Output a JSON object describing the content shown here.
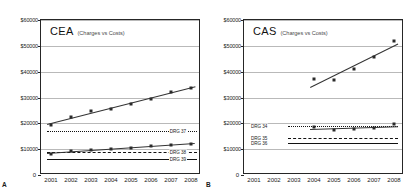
{
  "figure": {
    "panels": [
      {
        "letter": "A",
        "title": "CEA",
        "subtitle": "(Charges vs Costs)"
      },
      {
        "letter": "B",
        "title": "CAS",
        "subtitle": "(Charges vs Costs)"
      }
    ]
  },
  "chart_data": [
    {
      "type": "scatter",
      "panel": "A",
      "title": "CEA",
      "subtitle": "(Charges vs Costs)",
      "xlabel": "",
      "ylabel": "",
      "x": [
        2001,
        2002,
        2003,
        2004,
        2005,
        2006,
        2007,
        2008
      ],
      "xticklabels": [
        "2001",
        "2002",
        "2003",
        "2004",
        "2005",
        "2006",
        "2007",
        "2008"
      ],
      "ylim": [
        0,
        60000
      ],
      "yticks": [
        0,
        10000,
        20000,
        30000,
        40000,
        50000,
        60000
      ],
      "yticklabels": [
        "0",
        "$10000",
        "$20000",
        "$30000",
        "$40000",
        "$50000",
        "$60000"
      ],
      "grid": true,
      "legend": "inline-right",
      "series": [
        {
          "name": "Charges",
          "marker": "square",
          "trendline": true,
          "values": [
            19500,
            22300,
            24600,
            25600,
            27400,
            29500,
            32300,
            33600
          ]
        },
        {
          "name": "Costs",
          "marker": "square",
          "trendline": true,
          "values": [
            8200,
            9100,
            9700,
            10200,
            10600,
            11100,
            11600,
            12000
          ]
        }
      ],
      "reference_lines": [
        {
          "label": "DRG 37",
          "value": 17000,
          "style": "dotted"
        },
        {
          "label": "DRG 38",
          "value": 8800,
          "style": "dashed"
        },
        {
          "label": "DRG 39",
          "value": 6300,
          "style": "solid"
        }
      ]
    },
    {
      "type": "scatter",
      "panel": "B",
      "title": "CAS",
      "subtitle": "(Charges vs Costs)",
      "xlabel": "",
      "ylabel": "",
      "x": [
        2001,
        2002,
        2003,
        2004,
        2005,
        2006,
        2007,
        2008
      ],
      "xticklabels": [
        "2001",
        "2002",
        "2003",
        "2004",
        "2005",
        "2006",
        "2007",
        "2008"
      ],
      "ylim": [
        0,
        60000
      ],
      "yticks": [
        0,
        10000,
        20000,
        30000,
        40000,
        50000,
        60000
      ],
      "yticklabels": [
        "0",
        "$10000",
        "$20000",
        "$30000",
        "$40000",
        "$50000",
        "$60000"
      ],
      "grid": true,
      "legend": "inline-left",
      "series": [
        {
          "name": "Charges",
          "marker": "square",
          "trendline": true,
          "x": [
            2004,
            2005,
            2006,
            2007,
            2008
          ],
          "values": [
            37000,
            36800,
            41000,
            45500,
            51800
          ]
        },
        {
          "name": "Costs",
          "marker": "square",
          "trendline": true,
          "x": [
            2004,
            2005,
            2006,
            2007,
            2008
          ],
          "values": [
            18600,
            17600,
            17900,
            18100,
            19600
          ]
        }
      ],
      "reference_lines": [
        {
          "label": "DRG 34",
          "value": 19000,
          "style": "dotted"
        },
        {
          "label": "DRG 35",
          "value": 14400,
          "style": "dashed"
        },
        {
          "label": "DRG 36",
          "value": 12400,
          "style": "solid"
        }
      ]
    }
  ]
}
